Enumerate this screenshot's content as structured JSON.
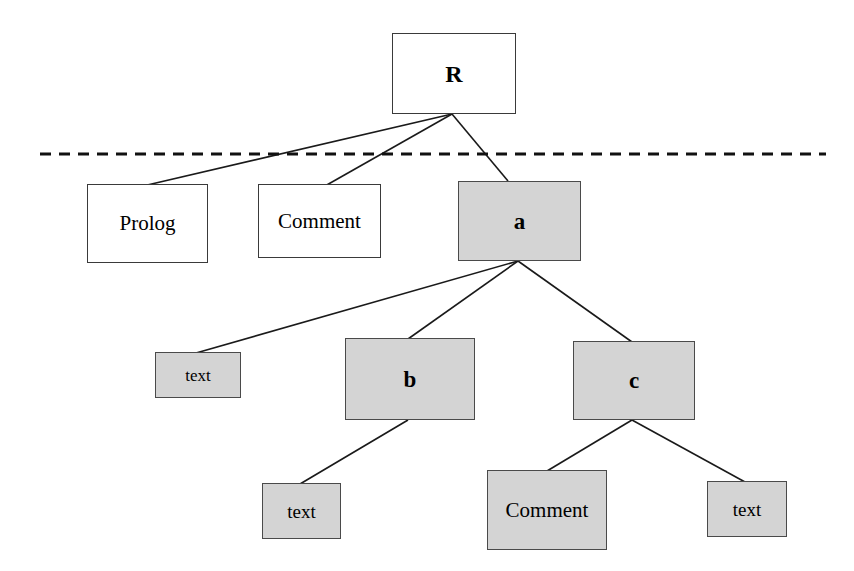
{
  "diagram": {
    "type": "tree",
    "background_color": "#ffffff",
    "node_fill_plain": "#ffffff",
    "node_fill_shaded": "#d4d4d4",
    "node_border_color": "#3a3a3a",
    "edge_color": "#1a1a1a",
    "separator": {
      "name": "dashed-separator-line",
      "style": "dashed",
      "color": "#111111",
      "x1": 40,
      "x2": 826,
      "y": 154,
      "thickness": 3,
      "dash": 11,
      "gap": 8
    },
    "nodes": [
      {
        "id": "root",
        "label": "R",
        "shaded": false,
        "bold": true,
        "font_size": 24,
        "x": 392,
        "y": 33,
        "width": 124,
        "height": 81
      },
      {
        "id": "prolog",
        "label": "Prolog",
        "shaded": false,
        "bold": false,
        "font_size": 21,
        "x": 87,
        "y": 184,
        "width": 121,
        "height": 79
      },
      {
        "id": "comment-top",
        "label": "Comment",
        "shaded": false,
        "bold": false,
        "font_size": 21,
        "x": 258,
        "y": 184,
        "width": 123,
        "height": 74
      },
      {
        "id": "a",
        "label": "a",
        "shaded": true,
        "bold": true,
        "font_size": 23,
        "x": 458,
        "y": 181,
        "width": 123,
        "height": 80
      },
      {
        "id": "text-a",
        "label": "text",
        "shaded": true,
        "bold": false,
        "font_size": 17,
        "x": 155,
        "y": 352,
        "width": 86,
        "height": 46
      },
      {
        "id": "b",
        "label": "b",
        "shaded": true,
        "bold": true,
        "font_size": 23,
        "x": 345,
        "y": 338,
        "width": 130,
        "height": 82
      },
      {
        "id": "c",
        "label": "c",
        "shaded": true,
        "bold": true,
        "font_size": 23,
        "x": 573,
        "y": 341,
        "width": 122,
        "height": 79
      },
      {
        "id": "text-b",
        "label": "text",
        "shaded": true,
        "bold": false,
        "font_size": 19,
        "x": 262,
        "y": 483,
        "width": 79,
        "height": 56
      },
      {
        "id": "comment-c",
        "label": "Comment",
        "shaded": true,
        "bold": false,
        "font_size": 21,
        "x": 487,
        "y": 470,
        "width": 120,
        "height": 80
      },
      {
        "id": "text-c",
        "label": "text",
        "shaded": true,
        "bold": false,
        "font_size": 19,
        "x": 707,
        "y": 481,
        "width": 80,
        "height": 56
      }
    ],
    "edges": [
      {
        "from": "root",
        "to": "prolog",
        "x1": 452,
        "y1": 114,
        "x2": 143,
        "y2": 186
      },
      {
        "from": "root",
        "to": "comment-top",
        "x1": 452,
        "y1": 114,
        "x2": 325,
        "y2": 186
      },
      {
        "from": "root",
        "to": "a",
        "x1": 452,
        "y1": 114,
        "x2": 508,
        "y2": 181
      },
      {
        "from": "a",
        "to": "text-a",
        "x1": 518,
        "y1": 261,
        "x2": 196,
        "y2": 353
      },
      {
        "from": "a",
        "to": "b",
        "x1": 518,
        "y1": 261,
        "x2": 408,
        "y2": 339
      },
      {
        "from": "a",
        "to": "c",
        "x1": 518,
        "y1": 261,
        "x2": 632,
        "y2": 342
      },
      {
        "from": "b",
        "to": "text-b",
        "x1": 408,
        "y1": 420,
        "x2": 300,
        "y2": 484
      },
      {
        "from": "c",
        "to": "comment-c",
        "x1": 632,
        "y1": 420,
        "x2": 547,
        "y2": 471
      },
      {
        "from": "c",
        "to": "text-c",
        "x1": 632,
        "y1": 420,
        "x2": 745,
        "y2": 482
      }
    ]
  }
}
